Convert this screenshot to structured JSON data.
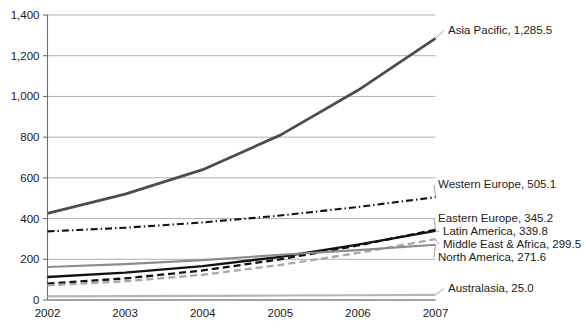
{
  "chart_data": {
    "type": "line",
    "title": "",
    "xlabel": "",
    "ylabel": "",
    "categories": [
      "2002",
      "2003",
      "2004",
      "2005",
      "2006",
      "2007"
    ],
    "x": [
      2002,
      2003,
      2004,
      2005,
      2006,
      2007
    ],
    "ylim": [
      0,
      1400
    ],
    "yticks": [
      0,
      200,
      400,
      600,
      800,
      1000,
      1200,
      1400
    ],
    "ytick_labels": [
      "0",
      "200",
      "400",
      "600",
      "800",
      "1,000",
      "1,200",
      "1,400"
    ],
    "grid": true,
    "legend_position": "right-inline-labels",
    "series": [
      {
        "name": "Asia Pacific",
        "end_value": 1285.5,
        "end_label": "Asia Pacific, 1,285.5",
        "values": [
          425.0,
          520.0,
          640.0,
          810.0,
          1030.0,
          1285.5
        ],
        "color": "#4d4d4d",
        "width": 2.8,
        "dash": "none"
      },
      {
        "name": "Western Europe",
        "end_value": 505.1,
        "end_label": "Western Europe, 505.1",
        "values": [
          337.0,
          355.0,
          381.0,
          415.0,
          457.0,
          505.1
        ],
        "color": "#111111",
        "width": 2.1,
        "dash": "dashdot"
      },
      {
        "name": "Eastern Europe",
        "end_value": 345.2,
        "end_label": "Eastern Europe, 345.2",
        "values": [
          80.0,
          106.0,
          145.0,
          200.0,
          268.0,
          345.2
        ],
        "color": "#111111",
        "width": 2.3,
        "dash": "dashed"
      },
      {
        "name": "Latin America",
        "end_value": 339.8,
        "end_label": "Latin America, 339.8",
        "values": [
          113.0,
          134.0,
          166.0,
          212.0,
          272.0,
          339.8
        ],
        "color": "#111111",
        "width": 2.3,
        "dash": "none"
      },
      {
        "name": "Middle East & Africa",
        "end_value": 299.5,
        "end_label": "Middle East & Africa, 299.5",
        "values": [
          72.0,
          92.0,
          124.0,
          172.0,
          231.0,
          299.5
        ],
        "color": "#a8a8a8",
        "width": 2.3,
        "dash": "dashed"
      },
      {
        "name": "North America",
        "end_value": 271.6,
        "end_label": "North America, 271.6",
        "values": [
          162.0,
          176.0,
          196.0,
          222.0,
          245.0,
          271.6
        ],
        "color": "#8c8c8c",
        "width": 2.1,
        "dash": "none"
      },
      {
        "name": "Australasia",
        "end_value": 25.0,
        "end_label": "Australasia, 25.0",
        "values": [
          18.0,
          19.0,
          20.5,
          22.0,
          23.5,
          25.0
        ],
        "color": "#b5b5b5",
        "width": 2.1,
        "dash": "none"
      }
    ],
    "annotations": [
      {
        "name": "asia-pacific",
        "text": "Asia Pacific, 1,285.5",
        "x": 448,
        "y": 34
      },
      {
        "name": "western-europe",
        "text": "Western Europe, 505.1",
        "x": 438,
        "y": 188
      },
      {
        "name": "eastern-europe",
        "text": "Eastern Europe, 345.2",
        "x": 438,
        "y": 222
      },
      {
        "name": "latin-america",
        "text": "Latin America, 339.8",
        "x": 443,
        "y": 235
      },
      {
        "name": "middle-east-africa",
        "text": "Middle East & Africa, 299.5",
        "x": 443,
        "y": 248
      },
      {
        "name": "north-america",
        "text": "North America, 271.6",
        "x": 438,
        "y": 261
      },
      {
        "name": "australasia",
        "text": "Australasia, 25.0",
        "x": 448,
        "y": 292
      }
    ]
  }
}
